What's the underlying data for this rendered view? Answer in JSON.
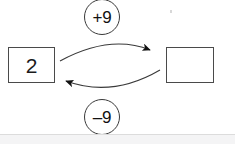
{
  "diagram": {
    "type": "inverse-operations-arrow-diagram",
    "start_box": {
      "value": "2",
      "filled": true
    },
    "result_box": {
      "value": "",
      "filled": false
    },
    "operations": [
      {
        "label": "+9",
        "direction": "left-to-right",
        "position": "top"
      },
      {
        "label": "–9",
        "direction": "right-to-left",
        "position": "bottom"
      }
    ],
    "colors": {
      "stroke": "#3a3a3a",
      "box_border": "#4a4a4a",
      "text": "#111111",
      "background": "#ffffff",
      "footer_strip": "#f4f4f5"
    }
  }
}
